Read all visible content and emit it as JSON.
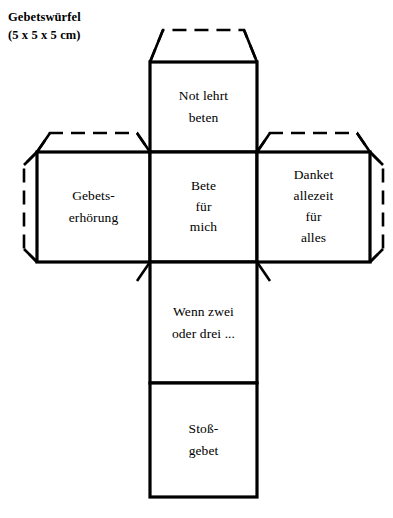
{
  "document": {
    "title_lines": [
      "Gebetswürfel",
      "(5 x 5 x 5 cm)"
    ],
    "title_main": "Gebetswürfel",
    "title_dimensions": "(5 x 5 x 5 cm)"
  },
  "diagram": {
    "kind": "cube-net",
    "shape": "cross",
    "stroke_color": "#000000",
    "fill_color": "#ffffff",
    "fold_line_style": "solid",
    "glue_flap_line_style": "dashed",
    "faces": [
      {
        "id": "top",
        "position": "top",
        "lines": [
          "Not lehrt",
          "beten"
        ]
      },
      {
        "id": "left",
        "position": "middle-left",
        "lines": [
          "Gebets-",
          "erhörung"
        ]
      },
      {
        "id": "center",
        "position": "middle-center",
        "lines": [
          "Bete",
          "für",
          "mich"
        ]
      },
      {
        "id": "right",
        "position": "middle-right",
        "lines": [
          "Danket",
          "allezeit",
          "für",
          "alles"
        ]
      },
      {
        "id": "lower",
        "position": "bottom-upper",
        "lines": [
          "Wenn zwei",
          "oder drei ..."
        ]
      },
      {
        "id": "bottom",
        "position": "bottom-lower",
        "lines": [
          "Stoß-",
          "gebet"
        ]
      }
    ],
    "flaps": [
      {
        "id": "flap-top-center",
        "edge": "top",
        "style": "dashed-trapezoid"
      },
      {
        "id": "flap-top-left",
        "edge": "top",
        "style": "dashed-trapezoid"
      },
      {
        "id": "flap-top-right",
        "edge": "top",
        "style": "dashed-trapezoid"
      },
      {
        "id": "flap-side-left",
        "edge": "left",
        "style": "dashed-octagon"
      },
      {
        "id": "flap-side-right",
        "edge": "right",
        "style": "dashed-octagon"
      }
    ]
  }
}
